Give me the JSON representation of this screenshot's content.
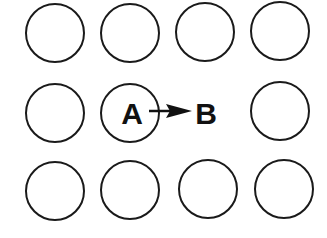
{
  "diagram": {
    "colors": {
      "stroke": "#1a1a1a",
      "text": "#111111",
      "background": "#ffffff"
    },
    "circles": [
      {
        "row": 1,
        "col": 1,
        "cx": 55,
        "cy": 33,
        "r": 29
      },
      {
        "row": 1,
        "col": 2,
        "cx": 130,
        "cy": 33,
        "r": 29
      },
      {
        "row": 1,
        "col": 3,
        "cx": 205,
        "cy": 32,
        "r": 29
      },
      {
        "row": 1,
        "col": 4,
        "cx": 280,
        "cy": 31,
        "r": 29
      },
      {
        "row": 2,
        "col": 1,
        "cx": 55,
        "cy": 113,
        "r": 29
      },
      {
        "row": 2,
        "col": 2,
        "cx": 130,
        "cy": 113,
        "r": 29,
        "label": "A"
      },
      {
        "row": 2,
        "col": 4,
        "cx": 280,
        "cy": 111,
        "r": 29
      },
      {
        "row": 3,
        "col": 1,
        "cx": 55,
        "cy": 191,
        "r": 29
      },
      {
        "row": 3,
        "col": 2,
        "cx": 130,
        "cy": 190,
        "r": 29
      },
      {
        "row": 3,
        "col": 3,
        "cx": 208,
        "cy": 189,
        "r": 29
      },
      {
        "row": 3,
        "col": 4,
        "cx": 284,
        "cy": 189,
        "r": 29
      }
    ],
    "labels": {
      "a": "A",
      "b": "B"
    },
    "arrow": {
      "from": "A",
      "to": "B"
    }
  }
}
